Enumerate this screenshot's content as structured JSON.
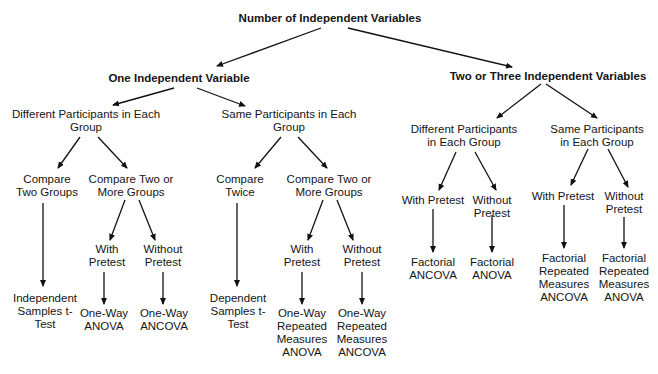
{
  "diagram": {
    "title": "Number of Independent Variables",
    "colors": {
      "line": "#111111",
      "text": "#151515",
      "background": "#ffffff"
    },
    "nodes": {
      "root": {
        "lines": [
          "Number of Independent Variables"
        ],
        "bold": true
      },
      "one_iv": {
        "lines": [
          "One Independent Variable"
        ],
        "bold": true
      },
      "two_iv": {
        "lines": [
          "Two or Three Independent Variables"
        ],
        "bold": true
      },
      "one_diff": {
        "lines": [
          "Different Participants in Each",
          "Group"
        ]
      },
      "one_same": {
        "lines": [
          "Same Participants in Each",
          "Group"
        ]
      },
      "two_diff": {
        "lines": [
          "Different Participants",
          "in Each Group"
        ]
      },
      "two_same": {
        "lines": [
          "Same Participants",
          "in Each Group"
        ]
      },
      "od_two": {
        "lines": [
          "Compare",
          "Two Groups"
        ]
      },
      "od_more": {
        "lines": [
          "Compare Two or",
          "More Groups"
        ]
      },
      "os_twice": {
        "lines": [
          "Compare",
          "Twice"
        ]
      },
      "os_more": {
        "lines": [
          "Compare Two or",
          "More Groups"
        ]
      },
      "od_with": {
        "lines": [
          "With",
          "Pretest"
        ]
      },
      "od_without": {
        "lines": [
          "Without",
          "Pretest"
        ]
      },
      "os_with": {
        "lines": [
          "With",
          "Pretest"
        ]
      },
      "os_without": {
        "lines": [
          "Without",
          "Pretest"
        ]
      },
      "td_with": {
        "lines": [
          "With Pretest"
        ]
      },
      "td_without": {
        "lines": [
          "Without",
          "Pretest"
        ]
      },
      "ts_with": {
        "lines": [
          "With Pretest"
        ]
      },
      "ts_without": {
        "lines": [
          "Without",
          "Pretest"
        ]
      },
      "r_ind_t": {
        "lines": [
          "Independent",
          "Samples t-",
          "Test"
        ]
      },
      "r_ow_anova": {
        "lines": [
          "One-Way",
          "ANOVA"
        ]
      },
      "r_ow_ancova": {
        "lines": [
          "One-Way",
          "ANCOVA"
        ]
      },
      "r_dep_t": {
        "lines": [
          "Dependent",
          "Samples t-",
          "Test"
        ]
      },
      "r_owrm_anova": {
        "lines": [
          "One-Way",
          "Repeated",
          "Measures",
          "ANOVA"
        ]
      },
      "r_owrm_ancova": {
        "lines": [
          "One-Way",
          "Repeated",
          "Measures",
          "ANCOVA"
        ]
      },
      "r_f_ancova": {
        "lines": [
          "Factorial",
          "ANCOVA"
        ]
      },
      "r_f_anova": {
        "lines": [
          "Factorial",
          "ANOVA"
        ]
      },
      "r_frm_ancova": {
        "lines": [
          "Factorial",
          "Repeated",
          "Measures",
          "ANCOVA"
        ]
      },
      "r_frm_anova": {
        "lines": [
          "Factorial",
          "Repeated",
          "Measures",
          "ANOVA"
        ]
      }
    },
    "edges": [
      [
        "root",
        "one_iv"
      ],
      [
        "root",
        "two_iv"
      ],
      [
        "one_iv",
        "one_diff"
      ],
      [
        "one_iv",
        "one_same"
      ],
      [
        "two_iv",
        "two_diff"
      ],
      [
        "two_iv",
        "two_same"
      ],
      [
        "one_diff",
        "od_two"
      ],
      [
        "one_diff",
        "od_more"
      ],
      [
        "one_same",
        "os_twice"
      ],
      [
        "one_same",
        "os_more"
      ],
      [
        "od_more",
        "od_with"
      ],
      [
        "od_more",
        "od_without"
      ],
      [
        "os_more",
        "os_with"
      ],
      [
        "os_more",
        "os_without"
      ],
      [
        "two_diff",
        "td_with"
      ],
      [
        "two_diff",
        "td_without"
      ],
      [
        "two_same",
        "ts_with"
      ],
      [
        "two_same",
        "ts_without"
      ],
      [
        "od_two",
        "r_ind_t"
      ],
      [
        "od_with",
        "r_ow_anova"
      ],
      [
        "od_without",
        "r_ow_ancova"
      ],
      [
        "os_twice",
        "r_dep_t"
      ],
      [
        "os_with",
        "r_owrm_anova"
      ],
      [
        "os_without",
        "r_owrm_ancova"
      ],
      [
        "td_with",
        "r_f_ancova"
      ],
      [
        "td_without",
        "r_f_anova"
      ],
      [
        "ts_with",
        "r_frm_ancova"
      ],
      [
        "ts_without",
        "r_frm_anova"
      ]
    ]
  }
}
